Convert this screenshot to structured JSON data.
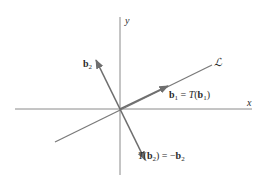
{
  "figure": {
    "colors": {
      "axis": "#8a8a8a",
      "line": "#7a7a7a",
      "vector": "#6e6e6e",
      "text": "#2a2a2a",
      "background": "#ffffff"
    },
    "axes": {
      "x_label": "x",
      "y_label": "y"
    },
    "line": {
      "label": "ℒ"
    },
    "vectors": {
      "b1": {
        "label_bold": "b",
        "label_sub": "1",
        "label_eq": " = ",
        "label_T": "T",
        "label_paren_open": "(",
        "label_bold2": "b",
        "label_sub2": "1",
        "label_paren_close": ")"
      },
      "b2": {
        "label_bold": "b",
        "label_sub": "2"
      },
      "Tb2": {
        "label_T": "T",
        "label_paren_open": "(",
        "label_bold": "b",
        "label_sub": "2",
        "label_paren_close": ")",
        "label_eq": " = −",
        "label_bold2": "b",
        "label_sub2": "2"
      }
    }
  }
}
